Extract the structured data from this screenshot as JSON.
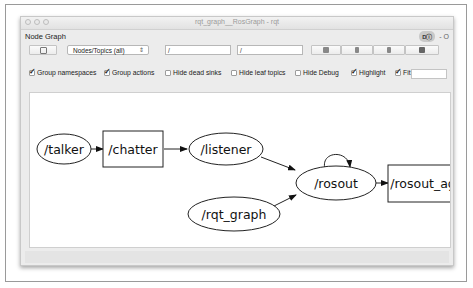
{
  "window": {
    "title": "rqt_graph__RosGraph - rqt"
  },
  "plugin": {
    "title": "Node Graph",
    "badge": "Dⓘ",
    "close": "- O"
  },
  "toolbar": {
    "refresh_icon": "refresh-icon",
    "filter_select": {
      "selected": "Nodes/Topics (all)"
    },
    "namespace_filter": {
      "value": "/"
    },
    "topic_filter": {
      "value": "/"
    },
    "buttons": [
      "load-dot-icon",
      "save-dot-icon",
      "save-svg-icon",
      "save-image-icon"
    ]
  },
  "options": {
    "group_namespaces": {
      "label": "Group namespaces",
      "checked": true
    },
    "group_actions": {
      "label": "Group actions",
      "checked": true
    },
    "hide_dead_sinks": {
      "label": "Hide dead sinks",
      "checked": false
    },
    "hide_leaf_topics": {
      "label": "Hide leaf topics",
      "checked": false
    },
    "hide_debug": {
      "label": "Hide Debug",
      "checked": false
    },
    "highlight": {
      "label": "Highlight",
      "checked": true
    },
    "fit": {
      "label": "Fit",
      "checked": true
    }
  },
  "graph": {
    "nodes": [
      {
        "id": "talker",
        "label": "/talker",
        "shape": "ellipse"
      },
      {
        "id": "chatter",
        "label": "/chatter",
        "shape": "box"
      },
      {
        "id": "listener",
        "label": "/listener",
        "shape": "ellipse"
      },
      {
        "id": "rosout",
        "label": "/rosout",
        "shape": "ellipse"
      },
      {
        "id": "rosout_agg",
        "label": "/rosout_agg",
        "shape": "box"
      },
      {
        "id": "rqt_graph",
        "label": "/rqt_graph",
        "shape": "ellipse"
      }
    ],
    "edges": [
      [
        "talker",
        "chatter"
      ],
      [
        "chatter",
        "listener"
      ],
      [
        "listener",
        "rosout"
      ],
      [
        "rqt_graph",
        "rosout"
      ],
      [
        "rosout",
        "rosout"
      ],
      [
        "rosout",
        "rosout_agg"
      ]
    ]
  }
}
